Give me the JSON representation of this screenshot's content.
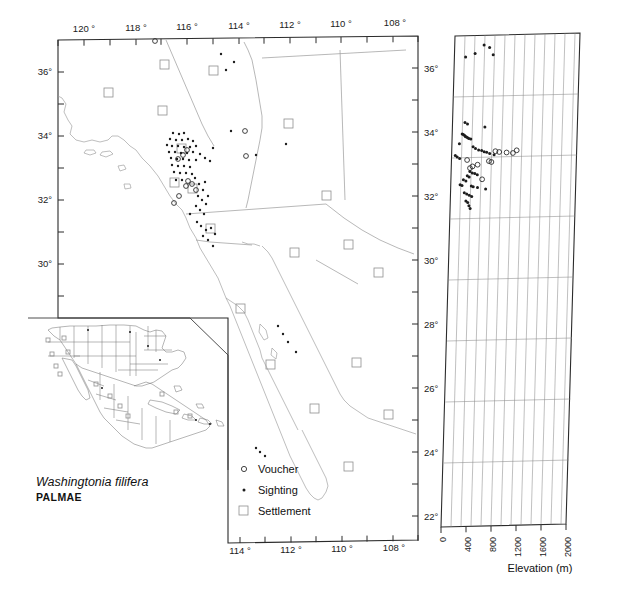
{
  "figure": {
    "species_name": "Washingtonia filifera",
    "family_name": "PALMAE"
  },
  "legend": {
    "items": [
      {
        "symbol": "circle",
        "label": "Voucher"
      },
      {
        "symbol": "dot",
        "label": "Sighting"
      },
      {
        "symbol": "square",
        "label": "Settlement"
      }
    ]
  },
  "main_map": {
    "top_axis_labels": [
      "120 °",
      "118 °",
      "116 °",
      "114 °",
      "112 °",
      "110 °",
      "108 °"
    ],
    "bottom_axis_labels": [
      "114 °",
      "112 °",
      "110 °",
      "108 °"
    ],
    "left_axis_labels": [
      "36°",
      "34°",
      "32°",
      "30°"
    ],
    "right_axis_labels": [
      "36°",
      "34°",
      "32°",
      "30°",
      "28°",
      "26°",
      "24°",
      "22°"
    ],
    "lon_range": [
      -121.2,
      -107.4
    ],
    "lat_range": [
      21.6,
      37.1
    ]
  },
  "elevation_panel": {
    "x_axis_title": "Elevation (m)",
    "x_tick_labels": [
      "0",
      "400",
      "800",
      "1200",
      "1600",
      "2000"
    ],
    "x_range": [
      0,
      2000
    ],
    "y_range": [
      21.6,
      37.1
    ]
  },
  "chart_data": {
    "type": "scatter",
    "title": "Washingtonia filifera",
    "xlabel": "Elevation (m)",
    "ylabel": "Latitude (degrees North)",
    "xlim": [
      0,
      2000
    ],
    "ylim": [
      22,
      37
    ],
    "grid": true,
    "legend_position": "map-inset-lower-center",
    "xticks": [
      0,
      400,
      800,
      1200,
      1600,
      2000
    ],
    "yticks": [
      22,
      24,
      26,
      28,
      30,
      32,
      34,
      36
    ],
    "series": [
      {
        "name": "Voucher",
        "marker": "open-circle",
        "points": [
          [
            700,
            33.45
          ],
          [
            760,
            33.42
          ],
          [
            880,
            33.4
          ],
          [
            980,
            33.38
          ],
          [
            600,
            33.15
          ],
          [
            640,
            33.12
          ],
          [
            420,
            33.05
          ],
          [
            300,
            32.95
          ],
          [
            500,
            32.6
          ],
          [
            1040,
            33.46
          ],
          [
            340,
            33.0
          ],
          [
            250,
            33.2
          ]
        ]
      },
      {
        "name": "Sighting",
        "marker": "filled-dot",
        "points": [
          [
            470,
            36.7
          ],
          [
            330,
            36.45
          ],
          [
            560,
            36.62
          ],
          [
            620,
            36.4
          ],
          [
            180,
            36.35
          ],
          [
            200,
            34.35
          ],
          [
            240,
            34.3
          ],
          [
            520,
            34.2
          ],
          [
            160,
            34.0
          ],
          [
            180,
            33.98
          ],
          [
            200,
            33.95
          ],
          [
            210,
            33.92
          ],
          [
            230,
            33.9
          ],
          [
            250,
            33.88
          ],
          [
            270,
            33.86
          ],
          [
            300,
            33.84
          ],
          [
            120,
            33.7
          ],
          [
            340,
            33.6
          ],
          [
            380,
            33.55
          ],
          [
            430,
            33.5
          ],
          [
            60,
            33.35
          ],
          [
            90,
            33.3
          ],
          [
            130,
            33.25
          ],
          [
            480,
            33.48
          ],
          [
            520,
            33.44
          ],
          [
            560,
            33.42
          ],
          [
            610,
            33.38
          ],
          [
            680,
            33.34
          ],
          [
            300,
            32.85
          ],
          [
            340,
            32.8
          ],
          [
            380,
            32.78
          ],
          [
            420,
            32.74
          ],
          [
            260,
            32.72
          ],
          [
            290,
            32.68
          ],
          [
            200,
            32.6
          ],
          [
            240,
            32.56
          ],
          [
            150,
            32.45
          ],
          [
            180,
            32.42
          ],
          [
            330,
            32.4
          ],
          [
            360,
            32.38
          ],
          [
            430,
            32.35
          ],
          [
            560,
            32.3
          ],
          [
            220,
            32.2
          ],
          [
            260,
            32.16
          ],
          [
            300,
            32.12
          ],
          [
            340,
            32.08
          ],
          [
            250,
            31.95
          ],
          [
            280,
            31.9
          ],
          [
            300,
            31.8
          ],
          [
            320,
            31.72
          ]
        ]
      }
    ]
  }
}
